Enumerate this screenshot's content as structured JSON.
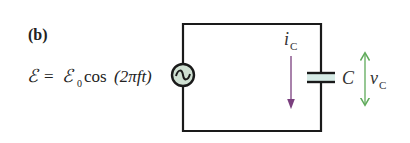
{
  "figure": {
    "panel_label": "(b)",
    "equation": {
      "lhs": "ℰ",
      "equals": "=",
      "amplitude_symbol": "ℰ",
      "amplitude_subscript": "0",
      "function": "cos",
      "argument": "(2πft)"
    },
    "source": {
      "icon": "ac-source-icon",
      "symbol": "∼",
      "fill": "#cfe0d2"
    },
    "current": {
      "symbol": "i",
      "subscript": "C",
      "color": "#7a3f7e"
    },
    "capacitor": {
      "label": "C",
      "dielectric_fill": "#d6ebe6"
    },
    "voltage": {
      "symbol": "v",
      "subscript": "C",
      "color": "#5faa5a"
    },
    "wire_color": "#1a1a1a"
  }
}
